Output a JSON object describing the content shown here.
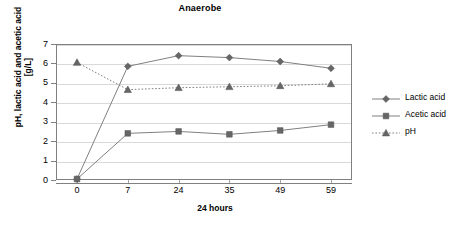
{
  "chart_data": {
    "type": "line",
    "title": "Anaerobe",
    "xlabel": "24 hours",
    "ylabel": "pH, lactic acid and acetic acid [g/L]",
    "categories": [
      "0",
      "7",
      "24",
      "35",
      "49",
      "59"
    ],
    "ylim": [
      0,
      7
    ],
    "ytick_labels": [
      "0",
      "1",
      "2",
      "3",
      "4",
      "5",
      "6",
      "7"
    ],
    "grid": true,
    "legend_position": "right",
    "series": [
      {
        "name": "Lactic acid",
        "marker": "diamond",
        "linestyle": "solid",
        "color": "#808080",
        "values": [
          0.05,
          5.85,
          6.4,
          6.3,
          6.1,
          5.75
        ]
      },
      {
        "name": "Acetic acid",
        "marker": "square",
        "linestyle": "solid",
        "color": "#808080",
        "values": [
          0.05,
          2.4,
          2.5,
          2.35,
          2.55,
          2.85
        ]
      },
      {
        "name": "pH",
        "marker": "triangle",
        "linestyle": "dotted",
        "color": "#808080",
        "values": [
          6.05,
          4.65,
          4.75,
          4.8,
          4.85,
          4.95
        ]
      }
    ]
  }
}
